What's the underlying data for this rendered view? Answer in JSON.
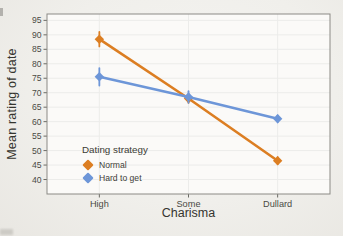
{
  "figure": {
    "panel_background": "#fbfaf8",
    "panel_border": "#8b8a85",
    "grid_color": "#ececе7",
    "grid_color_safe": "#ececE7",
    "gridline_color": "#ececea",
    "tick_color": "#6b6b65",
    "label_color": "#4a4a44",
    "title_color": "#35352f"
  },
  "chart_data": {
    "type": "line",
    "title": "",
    "xlabel": "Charisma",
    "ylabel": "Mean rating of date",
    "categories": [
      "High",
      "Some",
      "Dullard"
    ],
    "ylim": [
      35,
      97.2
    ],
    "yticks": [
      40,
      45,
      50,
      55,
      60,
      65,
      70,
      75,
      80,
      85,
      90,
      95
    ],
    "grid": true,
    "legend": {
      "title": "Dating strategy",
      "position": "inside-bottom-left"
    },
    "series": [
      {
        "name": "Normal",
        "color": "#DC7E22",
        "marker": "diamond",
        "values": [
          88.5,
          68,
          46.5
        ],
        "errors": [
          2.5,
          1.5,
          1.2
        ]
      },
      {
        "name": "Hard to get",
        "color": "#6D96D8",
        "marker": "diamond",
        "values": [
          75.5,
          68.5,
          61
        ],
        "errors": [
          3,
          2,
          1.2
        ]
      }
    ]
  }
}
